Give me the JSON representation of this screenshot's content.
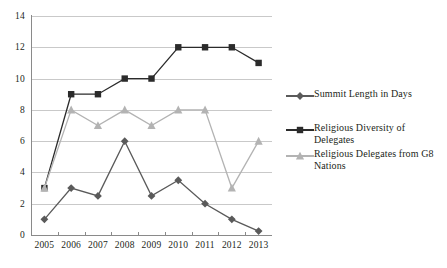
{
  "chart_data": {
    "type": "line",
    "title": "",
    "xlabel": "",
    "ylabel": "",
    "categories": [
      "2005",
      "2006",
      "2007",
      "2008",
      "2009",
      "2010",
      "2011",
      "2012",
      "2013"
    ],
    "ylim": [
      0,
      14
    ],
    "ytick_step": 2,
    "yticks": [
      0,
      2,
      4,
      6,
      8,
      10,
      12,
      14
    ],
    "grid": true,
    "legend_position": "right",
    "series": [
      {
        "name": "Summit Length in Days",
        "marker": "diamond",
        "color": "#5a5a5a",
        "values": [
          1,
          3,
          2.5,
          6,
          2.5,
          3.5,
          2,
          1,
          0.25
        ]
      },
      {
        "name": "Religious Diversity of Delegates",
        "marker": "square",
        "color": "#2b2b2b",
        "values": [
          3,
          9,
          9,
          10,
          10,
          12,
          12,
          12,
          11
        ]
      },
      {
        "name": "Religious Delegates from G8 Nations",
        "marker": "triangle",
        "color": "#b3b3b3",
        "values": [
          3,
          8,
          7,
          8,
          7,
          8,
          8,
          3,
          6
        ]
      }
    ]
  },
  "legend": {
    "items": [
      {
        "label": "Summit Length in Days"
      },
      {
        "label": "Religious Diversity of\nDelegates"
      },
      {
        "label": "Religious Delegates from G8\nNations"
      }
    ]
  },
  "caption": {
    "text": ""
  }
}
